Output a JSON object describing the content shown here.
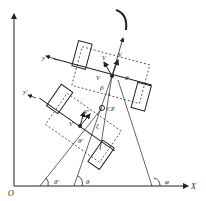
{
  "labels": {
    "origin": "O",
    "x_axis": "X",
    "y_axis_arrow": "",
    "body_x": "x",
    "body_y": "y",
    "body_y_prime": "y'",
    "v_x": "V",
    "v_x_sub": "x",
    "v_y": "V",
    "v_y_sub": "y",
    "v_prime": "V'",
    "v_y_prime": "V'",
    "theta": "θ",
    "theta_prime": "θ'",
    "beta": "β",
    "zeta": "ζ",
    "phi": "φ",
    "cp": "CP",
    "s": "s"
  }
}
